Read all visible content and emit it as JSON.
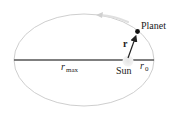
{
  "diagram": {
    "labels": {
      "planet": "Planet",
      "sun": "Sun",
      "r_vector": "r",
      "r_max_base": "r",
      "r_max_sub": "max",
      "r_0_base": "r",
      "r_0_sub": "0"
    },
    "colors": {
      "orbit": "#c8c8c8",
      "axis": "#555555",
      "sun": "#dcdcdc",
      "planet": "#111111",
      "vector": "#222222",
      "direction_arrow": "#d8d8d8"
    }
  }
}
